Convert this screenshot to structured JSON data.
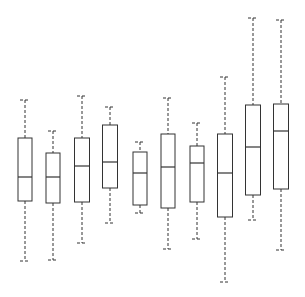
{
  "chart_data": {
    "type": "box",
    "title": "",
    "xlabel": "",
    "ylabel": "",
    "axes_visible": false,
    "grid": false,
    "legend": null,
    "categories": [
      "1",
      "2",
      "3",
      "4",
      "5",
      "6",
      "7",
      "8",
      "9",
      "10"
    ],
    "pixel_scale_note": "values in arbitrary units; no axis shown",
    "boxes": [
      {
        "x_center": 25,
        "width": 14,
        "whisker_top": 100,
        "q3": 138,
        "median": 177,
        "q1": 201,
        "whisker_bottom": 261
      },
      {
        "x_center": 53,
        "width": 14,
        "whisker_top": 131,
        "q3": 153,
        "median": 177,
        "q1": 203,
        "whisker_bottom": 260
      },
      {
        "x_center": 82,
        "width": 15,
        "whisker_top": 96,
        "q3": 138,
        "median": 166,
        "q1": 202,
        "whisker_bottom": 243
      },
      {
        "x_center": 110,
        "width": 15,
        "whisker_top": 107,
        "q3": 125,
        "median": 162,
        "q1": 188,
        "whisker_bottom": 223
      },
      {
        "x_center": 140,
        "width": 14,
        "whisker_top": 142,
        "q3": 152,
        "median": 173,
        "q1": 205,
        "whisker_bottom": 213
      },
      {
        "x_center": 168,
        "width": 14,
        "whisker_top": 98,
        "q3": 134,
        "median": 167,
        "q1": 208,
        "whisker_bottom": 249
      },
      {
        "x_center": 197,
        "width": 14,
        "whisker_top": 123,
        "q3": 146,
        "median": 163,
        "q1": 202,
        "whisker_bottom": 239
      },
      {
        "x_center": 225,
        "width": 15,
        "whisker_top": 77,
        "q3": 134,
        "median": 173,
        "q1": 217,
        "whisker_bottom": 282
      },
      {
        "x_center": 253,
        "width": 15,
        "whisker_top": 18,
        "q3": 105,
        "median": 147,
        "q1": 195,
        "whisker_bottom": 220
      },
      {
        "x_center": 281,
        "width": 15,
        "whisker_top": 20,
        "q3": 104,
        "median": 131,
        "q1": 189,
        "whisker_bottom": 250
      }
    ],
    "series": [
      {
        "name": "box-1",
        "values": {
          "max": 76,
          "q3": 61,
          "median": 45,
          "q1": 36,
          "min": 12
        }
      },
      {
        "name": "box-2",
        "values": {
          "max": 64,
          "q3": 55,
          "median": 45,
          "q1": 35,
          "min": 12
        }
      },
      {
        "name": "box-3",
        "values": {
          "max": 78,
          "q3": 61,
          "median": 50,
          "q1": 35,
          "min": 19
        }
      },
      {
        "name": "box-4",
        "values": {
          "max": 73,
          "q3": 66,
          "median": 51,
          "q1": 41,
          "min": 27
        }
      },
      {
        "name": "box-5",
        "values": {
          "max": 59,
          "q3": 55,
          "median": 47,
          "q1": 34,
          "min": 31
        }
      },
      {
        "name": "box-6",
        "values": {
          "max": 77,
          "q3": 62,
          "median": 49,
          "q1": 33,
          "min": 16
        }
      },
      {
        "name": "box-7",
        "values": {
          "max": 67,
          "q3": 58,
          "median": 51,
          "q1": 35,
          "min": 20
        }
      },
      {
        "name": "box-8",
        "values": {
          "max": 85,
          "q3": 62,
          "median": 47,
          "q1": 29,
          "min": 3
        }
      },
      {
        "name": "box-9",
        "values": {
          "max": 109,
          "q3": 74,
          "median": 57,
          "q1": 38,
          "min": 28
        }
      },
      {
        "name": "box-10",
        "values": {
          "max": 108,
          "q3": 74,
          "median": 64,
          "q1": 40,
          "min": 16
        }
      }
    ]
  },
  "style": {
    "line_color": "#333333",
    "background": "#ffffff"
  }
}
